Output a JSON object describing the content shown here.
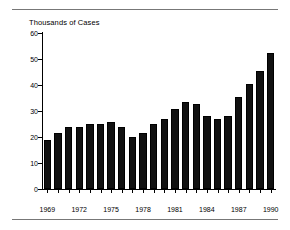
{
  "figure": {
    "top_rule": "horizontal-rule",
    "bottom_rule": "horizontal-rule"
  },
  "chart_data": {
    "type": "bar",
    "title": "Thousands of Cases",
    "xlabel": "",
    "ylabel": "Thousands of Cases",
    "ylim": [
      0,
      60
    ],
    "yticks": [
      0,
      10,
      20,
      30,
      40,
      50,
      60
    ],
    "ytick_labels": [
      "0",
      "10",
      "20",
      "30",
      "40",
      "50",
      "60"
    ],
    "grid": false,
    "legend": false,
    "bar_color": "#111111",
    "categories": [
      "1969",
      "1970",
      "1971",
      "1972",
      "1973",
      "1974",
      "1975",
      "1976",
      "1977",
      "1978",
      "1979",
      "1980",
      "1981",
      "1982",
      "1983",
      "1984",
      "1985",
      "1986",
      "1987",
      "1988",
      "1989",
      "1990"
    ],
    "values": [
      19.0,
      21.7,
      23.7,
      23.7,
      24.9,
      24.9,
      25.9,
      23.7,
      19.9,
      21.7,
      24.9,
      26.8,
      30.7,
      33.5,
      32.8,
      27.9,
      26.8,
      27.9,
      35.4,
      40.3,
      45.5,
      52.2
    ],
    "xtick_labels": [
      "1969",
      "1972",
      "1975",
      "1978",
      "1981",
      "1984",
      "1987",
      "1990"
    ],
    "xtick_categories": [
      "1969",
      "1972",
      "1975",
      "1978",
      "1981",
      "1984",
      "1987",
      "1990"
    ]
  }
}
